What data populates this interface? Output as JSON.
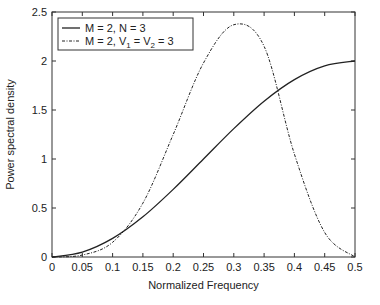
{
  "chart_data": {
    "type": "line",
    "title": "",
    "xlabel": "Normalized Frequency",
    "ylabel": "Power spectral density",
    "xlim": [
      0,
      0.5
    ],
    "ylim": [
      0,
      2.5
    ],
    "xticks": [
      "0",
      "0.05",
      "0.1",
      "0.15",
      "0.2",
      "0.25",
      "0.3",
      "0.35",
      "0.4",
      "0.45",
      "0.5"
    ],
    "yticks": [
      "0",
      "0.5",
      "1",
      "1.5",
      "2",
      "2.5"
    ],
    "grid": false,
    "legend_position": "upper left",
    "x": [
      0,
      0.05,
      0.1,
      0.15,
      0.2,
      0.25,
      0.3,
      0.35,
      0.4,
      0.45,
      0.5
    ],
    "series": [
      {
        "name": "M = 2, N = 3",
        "style": "solid",
        "values": [
          0,
          0.05,
          0.19,
          0.41,
          0.69,
          1.0,
          1.31,
          1.59,
          1.81,
          1.95,
          2.0
        ]
      },
      {
        "name": "M = 2, V1 = V2 = 3",
        "style": "dashdot",
        "values": [
          0,
          0.02,
          0.15,
          0.55,
          1.25,
          1.98,
          2.37,
          2.15,
          1.05,
          0.25,
          0
        ]
      }
    ]
  },
  "legend": {
    "entry1": "M = 2, N = 3",
    "entry2_prefix": "M = 2, V",
    "entry2_sub1": "1",
    "entry2_mid": " = V",
    "entry2_sub2": "2",
    "entry2_suffix": " = 3"
  }
}
